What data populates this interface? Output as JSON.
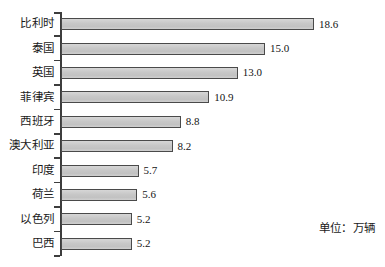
{
  "chart_data": {
    "type": "bar",
    "orientation": "horizontal",
    "title": "",
    "xlabel": "",
    "ylabel": "",
    "unit_note": "单位：万辆",
    "grid": false,
    "legend": null,
    "axis_range": [
      0,
      18.6
    ],
    "bar_fill_color": "#c9c9c9",
    "bar_border_color": "#4a4a4a",
    "axis_color": "#3d3d3d",
    "background_color": "#ffffff",
    "categories": [
      "比利时",
      "泰国",
      "英国",
      "菲律宾",
      "西班牙",
      "澳大利亚",
      "印度",
      "荷兰",
      "以色列",
      "巴西"
    ],
    "values": [
      18.6,
      15.0,
      13.0,
      10.9,
      8.8,
      8.2,
      5.7,
      5.6,
      5.2,
      5.2
    ],
    "value_labels": [
      "18.6",
      "15.0",
      "13.0",
      "10.9",
      "8.8",
      "8.2",
      "5.7",
      "5.6",
      "5.2",
      "5.2"
    ],
    "rows": [
      {
        "label": "比利时",
        "value": 18.6,
        "value_label": "18.6"
      },
      {
        "label": "泰国",
        "value": 15.0,
        "value_label": "15.0"
      },
      {
        "label": "英国",
        "value": 13.0,
        "value_label": "13.0"
      },
      {
        "label": "菲律宾",
        "value": 10.9,
        "value_label": "10.9"
      },
      {
        "label": "西班牙",
        "value": 8.8,
        "value_label": "8.8"
      },
      {
        "label": "澳大利亚",
        "value": 8.2,
        "value_label": "8.2"
      },
      {
        "label": "印度",
        "value": 5.7,
        "value_label": "5.7"
      },
      {
        "label": "荷兰",
        "value": 5.6,
        "value_label": "5.6"
      },
      {
        "label": "以色列",
        "value": 5.2,
        "value_label": "5.2"
      },
      {
        "label": "巴西",
        "value": 5.2,
        "value_label": "5.2"
      }
    ]
  }
}
